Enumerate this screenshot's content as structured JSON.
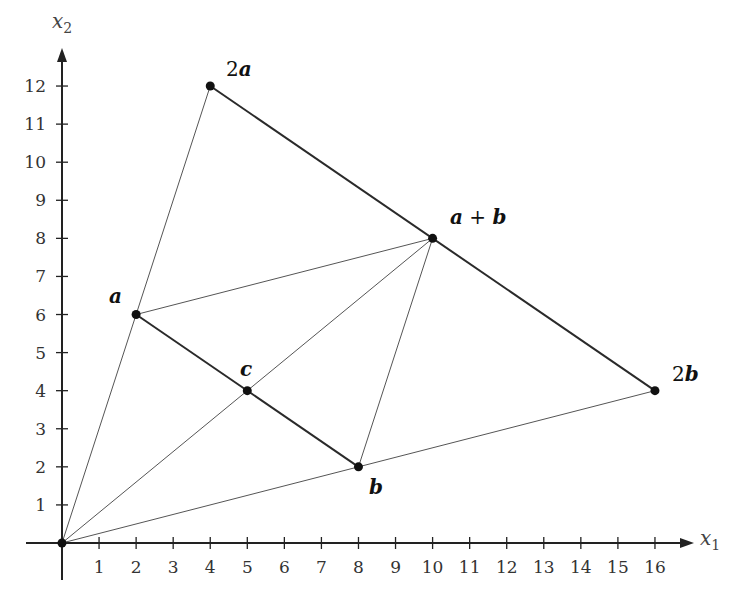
{
  "chart_data": {
    "type": "diagram",
    "title": "",
    "axes": {
      "x": {
        "label": "x",
        "subscript": "1",
        "min": 0,
        "max": 16,
        "ticks": [
          1,
          2,
          3,
          4,
          5,
          6,
          7,
          8,
          9,
          10,
          11,
          12,
          13,
          14,
          15,
          16
        ]
      },
      "y": {
        "label": "x",
        "subscript": "2",
        "min": 0,
        "max": 12,
        "ticks": [
          1,
          2,
          3,
          4,
          5,
          6,
          7,
          8,
          9,
          10,
          11,
          12
        ]
      }
    },
    "points": [
      {
        "id": "origin",
        "label": "",
        "x": 0,
        "y": 0
      },
      {
        "id": "a",
        "label": "a",
        "coef": "",
        "x": 2,
        "y": 6
      },
      {
        "id": "b",
        "label": "b",
        "coef": "",
        "x": 8,
        "y": 2
      },
      {
        "id": "c",
        "label": "c",
        "coef": "",
        "x": 5,
        "y": 4
      },
      {
        "id": "a_plus_b",
        "label": "a + b",
        "x": 10,
        "y": 8
      },
      {
        "id": "two_a",
        "label": "a",
        "coef": "2",
        "x": 4,
        "y": 12
      },
      {
        "id": "two_b",
        "label": "b",
        "coef": "2",
        "x": 16,
        "y": 4
      }
    ],
    "segments": [
      {
        "from": "two_a",
        "to": "two_b",
        "weight": "thick"
      },
      {
        "from": "a",
        "to": "b",
        "weight": "thick"
      },
      {
        "from": "origin",
        "to": "two_a",
        "weight": "thin"
      },
      {
        "from": "origin",
        "to": "two_b",
        "weight": "thin"
      },
      {
        "from": "origin",
        "to": "a_plus_b",
        "weight": "thin"
      },
      {
        "from": "a",
        "to": "a_plus_b",
        "weight": "thin"
      },
      {
        "from": "b",
        "to": "a_plus_b",
        "weight": "thin"
      }
    ]
  },
  "labels": {
    "x_axis": "x",
    "x_axis_sub": "1",
    "y_axis": "x",
    "y_axis_sub": "2",
    "a": "a",
    "b": "b",
    "c": "c",
    "a_plus_b_a": "a",
    "a_plus_b_plus": " + ",
    "a_plus_b_b": "b",
    "two_a_coef": "2",
    "two_a_vec": "a",
    "two_b_coef": "2",
    "two_b_vec": "b"
  },
  "ticks": {
    "x": [
      "1",
      "2",
      "3",
      "4",
      "5",
      "6",
      "7",
      "8",
      "9",
      "10",
      "11",
      "12",
      "13",
      "14",
      "15",
      "16"
    ],
    "y": [
      "1",
      "2",
      "3",
      "4",
      "5",
      "6",
      "7",
      "8",
      "9",
      "10",
      "11",
      "12"
    ]
  }
}
